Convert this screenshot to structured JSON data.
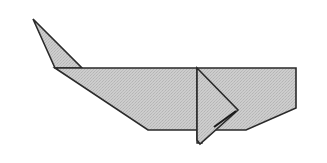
{
  "diagram": {
    "colors": {
      "background": "#ffffff",
      "fill": "#c8c8c8",
      "stroke": "#2a2a2a"
    },
    "shapes": {
      "tail": "33,19 82,68 55,68",
      "body": "55,68 296,68 296,108 246,130 148,130",
      "fin_back": "197,68 197,143 202,143 202,130",
      "fin": "197,68 238,110 200,144 197,140"
    }
  }
}
